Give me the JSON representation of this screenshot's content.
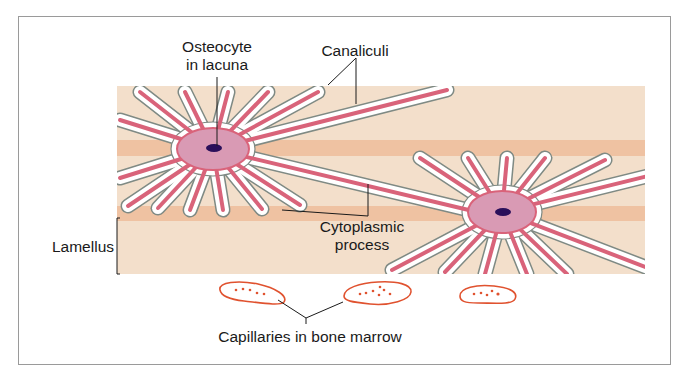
{
  "diagram": {
    "labels": {
      "osteocyte_line1": "Osteocyte",
      "osteocyte_line2": "in lacuna",
      "canaliculi": "Canaliculi",
      "cytoplasmic_line1": "Cytoplasmic",
      "cytoplasmic_line2": "process",
      "lamellus": "Lamellus",
      "capillaries": "Capillaries in bone marrow"
    },
    "colors": {
      "matrix": "#f3dfcb",
      "band": "#efc2a2",
      "canal_fill": "#ffffff",
      "canal_outline": "#7f8a84",
      "process": "#d9637a",
      "cell_body": "#d99ab4",
      "nucleus": "#2a0f5a",
      "capillary_outline": "#e0522f",
      "leader_line": "#1a1a1a",
      "frame": "#9a9a9a"
    },
    "cells": [
      {
        "name": "osteocyte-left",
        "cx": 213,
        "cy": 149
      },
      {
        "name": "osteocyte-right",
        "cx": 502,
        "cy": 212
      }
    ],
    "capillaries": [
      {
        "name": "capillary-1",
        "cx": 250,
        "cy": 294
      },
      {
        "name": "capillary-2",
        "cx": 377,
        "cy": 292
      },
      {
        "name": "capillary-3",
        "cx": 488,
        "cy": 293
      }
    ]
  }
}
